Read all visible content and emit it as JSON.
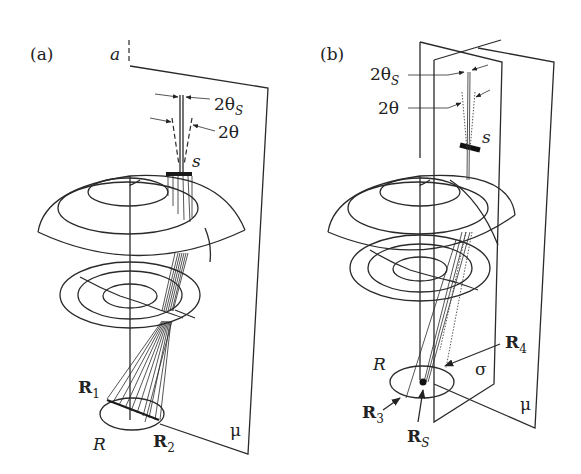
{
  "figure": {
    "panels": [
      {
        "id": "a",
        "label": "(a)",
        "axis_label": "a",
        "angle_labels": {
          "theta_s": "2θ",
          "theta_s_sub": "S",
          "theta": "2θ"
        },
        "slit_label": "s",
        "plane_label": "μ",
        "ring_label": "R",
        "points": [
          {
            "name": "R",
            "sub": "1"
          },
          {
            "name": "R",
            "sub": "2"
          }
        ]
      },
      {
        "id": "b",
        "label": "(b)",
        "angle_labels": {
          "theta_s": "2θ",
          "theta_s_sub": "S",
          "theta": "2θ"
        },
        "slit_label": "s",
        "plane_labels": {
          "mu": "μ",
          "sigma": "σ"
        },
        "ring_label": "R",
        "points": [
          {
            "name": "R",
            "sub": "3"
          },
          {
            "name": "R",
            "sub": "4"
          },
          {
            "name": "R",
            "sub": "S"
          }
        ]
      }
    ]
  }
}
